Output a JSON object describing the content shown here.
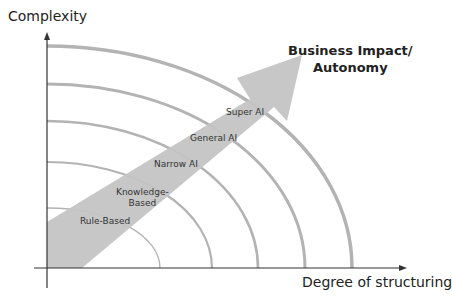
{
  "diagram": {
    "y_axis_title": "Complexity",
    "x_axis_title": "Degree of structuring",
    "arrow_label_line1": "Business Impact/",
    "arrow_label_line2": "Autonomy",
    "stages": [
      {
        "label_line1": "Rule-Based",
        "label_line2": ""
      },
      {
        "label_line1": "Knowledge-",
        "label_line2": "Based"
      },
      {
        "label_line1": "Narrow AI",
        "label_line2": ""
      },
      {
        "label_line1": "General AI",
        "label_line2": ""
      },
      {
        "label_line1": "Super AI",
        "label_line2": ""
      }
    ],
    "colors": {
      "arc": "#b3b3b3",
      "arrow": "#c4c4c4",
      "axis": "#333333",
      "text": "#222222"
    }
  }
}
